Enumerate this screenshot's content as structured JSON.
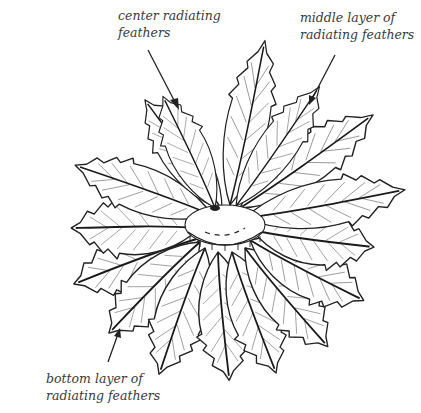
{
  "diagram": {
    "labels": {
      "center": {
        "line1": "center radiating",
        "line2": "feathers"
      },
      "middle": {
        "line1": "middle layer of",
        "line2": "radiating feathers"
      },
      "bottom": {
        "line1": "bottom layer of",
        "line2": "radiating feathers"
      }
    },
    "arrows": [
      {
        "name": "center-arrow",
        "from": [
          148,
          50
        ],
        "to": [
          178,
          108
        ]
      },
      {
        "name": "middle-arrow",
        "from": [
          335,
          55
        ],
        "to": [
          310,
          103
        ]
      },
      {
        "name": "bottom-arrow",
        "from": [
          108,
          360
        ],
        "to": [
          120,
          328
        ]
      }
    ],
    "colors": {
      "ink": "#222222",
      "label": "#3a3a3a",
      "background": "#ffffff"
    }
  }
}
